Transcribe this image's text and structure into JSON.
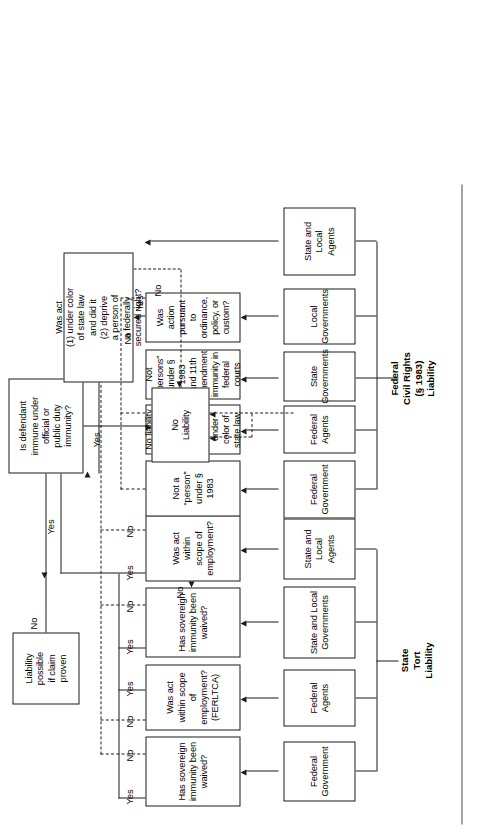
{
  "diagram": {
    "orientation": "rotated-90-ccw"
  },
  "categories": [
    {
      "id": "state-tort",
      "label": "State\nTort\nLiability"
    },
    {
      "id": "federal-civil-rights",
      "label": "Federal\nCivil Rights\n(§ 1983)\nLiability"
    }
  ],
  "defendants": {
    "state_tort": [
      {
        "id": "d1",
        "label": "Federal\nGovernment"
      },
      {
        "id": "d2",
        "label": "Federal\nAgents"
      },
      {
        "id": "d3",
        "label": "State and Local\nGovernments"
      },
      {
        "id": "d4",
        "label": "State and Local\nAgents"
      }
    ],
    "civil_rights": [
      {
        "id": "c1",
        "label": "Federal\nGovernment"
      },
      {
        "id": "c2",
        "label": "Federal\nAgents"
      },
      {
        "id": "c3",
        "label": "State\nGovernments"
      },
      {
        "id": "c4",
        "label": "Local\nGovernments"
      },
      {
        "id": "c5",
        "label": "State and Local\nAgents"
      }
    ]
  },
  "questions": {
    "state_tort": [
      {
        "id": "q1",
        "label": "Has sovereign\nimmunity been waived?"
      },
      {
        "id": "q2",
        "label": "Was act within scope\nof employment?\n(FERLTCA)"
      },
      {
        "id": "q3",
        "label": "Has sovereign\nimmunity been waived?"
      },
      {
        "id": "q4",
        "label": "Was act within\nscope of employment?"
      }
    ],
    "civil_rights": [
      {
        "id": "r1",
        "label": "Not a “person”\nunder § 1983"
      },
      {
        "id": "r2",
        "label": "No liability for federal action,\nbut possible for action under\ncolor of state law."
      },
      {
        "id": "r3",
        "label": "Not “persons” under § 1983\nand 11th amendment\nimmunity in federal courts"
      },
      {
        "id": "r4",
        "label": "Was action pursuant to\nordinance, policy, or custom?"
      }
    ]
  },
  "decisions": {
    "immunity": {
      "id": "dec-immunity",
      "label": "Is defendant\nimmune under\nofficial or\npublic duty\nimmunity?"
    },
    "color_of_law": {
      "id": "dec-color-of-law",
      "label": "Was act\n(1) under color\nof state law\nand did it\n(2) deprive\na person of\na federally\nsecured right?"
    }
  },
  "outcomes": {
    "liability_possible": {
      "id": "out-liability",
      "label": "Liability\npossible\nif claim\nproven"
    },
    "no_liability": {
      "id": "out-no-liability",
      "label": "No\nLiability"
    }
  },
  "edge_labels": {
    "yes": "Yes",
    "no": "No",
    "q1_yes": "Yes",
    "q1_no": "No",
    "q2_no": "No",
    "q2_yes": "Yes",
    "q3_yes": "Yes",
    "q3_no": "No",
    "q4_yes": "Yes",
    "q4_no": "No",
    "r4_no": "No",
    "r4_yes": "Yes",
    "immunity_yes": "Yes",
    "immunity_no": "No",
    "col_no": "No",
    "merge_yes": "Yes"
  },
  "colors": {
    "stroke": "#1a1a1a",
    "background": "#ffffff",
    "rule": "#4a4a4a"
  }
}
